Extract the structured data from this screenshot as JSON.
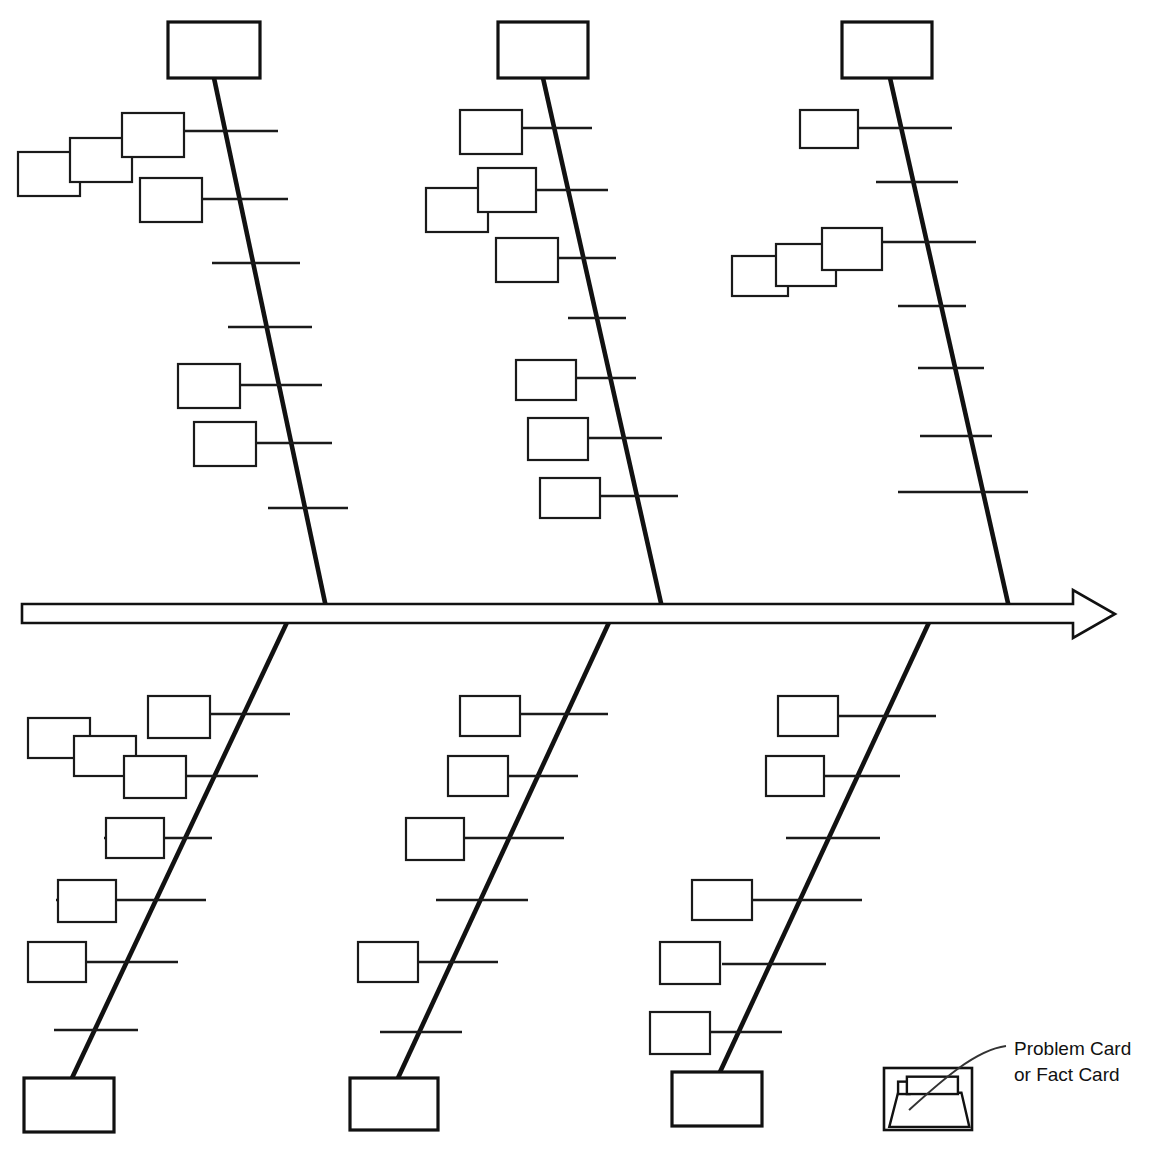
{
  "page": {
    "width": 1149,
    "height": 1162,
    "background_color": "#ffffff",
    "ink_color": "#111111"
  },
  "legend": {
    "label_line_1": "Problem Card",
    "label_line_2": "or Fact Card",
    "icon_name": "card-tray-icon",
    "box": {
      "x": 884,
      "y": 1068,
      "w": 88,
      "h": 62
    },
    "text_x": 1014,
    "text_y_1": 1050,
    "text_y_2": 1076,
    "leader": "M 1006 1046 C 975 1050 940 1082 909 1110"
  },
  "spine": {
    "name": "main-spine-arrow",
    "y_top": 604,
    "y_bottom": 623,
    "x_start": 22,
    "x_body_end": 1073,
    "arrow_tip_x": 1115,
    "arrow_top_y": 590,
    "arrow_bottom_y": 638,
    "outline_points": "22,604 1073,604 1073,590 1115,614 1073,638 1073,623 22,623"
  },
  "chart_data": {
    "type": "diagram",
    "diagram_type": "fishbone",
    "branch_count": 6,
    "upper_branch_count": 3,
    "lower_branch_count": 3,
    "note": "Blank cause-and-effect template: all category head boxes and problem/fact cards are empty."
  },
  "branches": [
    {
      "id": "upper-left",
      "side": "upper",
      "index": 1,
      "line": {
        "x1": 214,
        "y1": 78,
        "x2": 327,
        "y2": 612
      },
      "head": {
        "x": 168,
        "y": 22,
        "w": 92,
        "h": 56
      },
      "ribs": [
        {
          "x1": 124,
          "y1": 131,
          "x2": 278,
          "y2": 131
        },
        {
          "x1": 142,
          "y1": 199,
          "x2": 288,
          "y2": 199
        },
        {
          "x1": 212,
          "y1": 263,
          "x2": 300,
          "y2": 263
        },
        {
          "x1": 228,
          "y1": 327,
          "x2": 312,
          "y2": 327
        },
        {
          "x1": 228,
          "y1": 385,
          "x2": 322,
          "y2": 385
        },
        {
          "x1": 248,
          "y1": 443,
          "x2": 332,
          "y2": 443
        },
        {
          "x1": 268,
          "y1": 508,
          "x2": 348,
          "y2": 508
        }
      ],
      "cards": [
        {
          "x": 18,
          "y": 152,
          "w": 62,
          "h": 44,
          "z": 1
        },
        {
          "x": 70,
          "y": 138,
          "w": 62,
          "h": 44,
          "z": 2
        },
        {
          "x": 122,
          "y": 113,
          "w": 62,
          "h": 44,
          "z": 3
        },
        {
          "x": 140,
          "y": 178,
          "w": 62,
          "h": 44,
          "z": 4
        },
        {
          "x": 178,
          "y": 364,
          "w": 62,
          "h": 44,
          "z": 5
        },
        {
          "x": 194,
          "y": 422,
          "w": 62,
          "h": 44,
          "z": 6
        }
      ]
    },
    {
      "id": "upper-middle",
      "side": "upper",
      "index": 2,
      "line": {
        "x1": 543,
        "y1": 78,
        "x2": 663,
        "y2": 612
      },
      "head": {
        "x": 498,
        "y": 22,
        "w": 90,
        "h": 56
      },
      "ribs": [
        {
          "x1": 520,
          "y1": 128,
          "x2": 592,
          "y2": 128
        },
        {
          "x1": 528,
          "y1": 190,
          "x2": 608,
          "y2": 190
        },
        {
          "x1": 556,
          "y1": 258,
          "x2": 616,
          "y2": 258
        },
        {
          "x1": 568,
          "y1": 318,
          "x2": 626,
          "y2": 318
        },
        {
          "x1": 576,
          "y1": 378,
          "x2": 636,
          "y2": 378
        },
        {
          "x1": 586,
          "y1": 438,
          "x2": 662,
          "y2": 438
        },
        {
          "x1": 596,
          "y1": 496,
          "x2": 678,
          "y2": 496
        }
      ],
      "cards": [
        {
          "x": 460,
          "y": 110,
          "w": 62,
          "h": 44,
          "z": 1
        },
        {
          "x": 426,
          "y": 188,
          "w": 62,
          "h": 44,
          "z": 2
        },
        {
          "x": 478,
          "y": 168,
          "w": 58,
          "h": 44,
          "z": 3
        },
        {
          "x": 496,
          "y": 238,
          "w": 62,
          "h": 44,
          "z": 4
        },
        {
          "x": 516,
          "y": 360,
          "w": 60,
          "h": 40,
          "z": 5
        },
        {
          "x": 528,
          "y": 418,
          "w": 60,
          "h": 42,
          "z": 6
        },
        {
          "x": 540,
          "y": 478,
          "w": 60,
          "h": 40,
          "z": 7
        }
      ]
    },
    {
      "id": "upper-right",
      "side": "upper",
      "index": 3,
      "line": {
        "x1": 890,
        "y1": 78,
        "x2": 1010,
        "y2": 612
      },
      "head": {
        "x": 842,
        "y": 22,
        "w": 90,
        "h": 56
      },
      "ribs": [
        {
          "x1": 858,
          "y1": 128,
          "x2": 952,
          "y2": 128
        },
        {
          "x1": 876,
          "y1": 182,
          "x2": 958,
          "y2": 182
        },
        {
          "x1": 880,
          "y1": 242,
          "x2": 976,
          "y2": 242
        },
        {
          "x1": 898,
          "y1": 306,
          "x2": 966,
          "y2": 306
        },
        {
          "x1": 918,
          "y1": 368,
          "x2": 984,
          "y2": 368
        },
        {
          "x1": 920,
          "y1": 436,
          "x2": 992,
          "y2": 436
        },
        {
          "x1": 898,
          "y1": 492,
          "x2": 1028,
          "y2": 492
        }
      ],
      "cards": [
        {
          "x": 800,
          "y": 110,
          "w": 58,
          "h": 38,
          "z": 1
        },
        {
          "x": 732,
          "y": 256,
          "w": 56,
          "h": 40,
          "z": 2
        },
        {
          "x": 776,
          "y": 244,
          "w": 60,
          "h": 42,
          "z": 3
        },
        {
          "x": 822,
          "y": 228,
          "w": 60,
          "h": 42,
          "z": 4
        }
      ]
    },
    {
      "id": "lower-left",
      "side": "lower",
      "index": 4,
      "line": {
        "x1": 290,
        "y1": 616,
        "x2": 72,
        "y2": 1078
      },
      "head": {
        "x": 24,
        "y": 1078,
        "w": 90,
        "h": 54
      },
      "ribs": [
        {
          "x1": 148,
          "y1": 714,
          "x2": 290,
          "y2": 714
        },
        {
          "x1": 126,
          "y1": 776,
          "x2": 258,
          "y2": 776
        },
        {
          "x1": 104,
          "y1": 838,
          "x2": 212,
          "y2": 838
        },
        {
          "x1": 56,
          "y1": 900,
          "x2": 206,
          "y2": 900
        },
        {
          "x1": 28,
          "y1": 962,
          "x2": 178,
          "y2": 962
        },
        {
          "x1": 54,
          "y1": 1030,
          "x2": 138,
          "y2": 1030
        }
      ],
      "cards": [
        {
          "x": 28,
          "y": 718,
          "w": 62,
          "h": 40,
          "z": 1
        },
        {
          "x": 74,
          "y": 736,
          "w": 62,
          "h": 40,
          "z": 2
        },
        {
          "x": 124,
          "y": 756,
          "w": 62,
          "h": 42,
          "z": 3
        },
        {
          "x": 148,
          "y": 696,
          "w": 62,
          "h": 42,
          "z": 4
        },
        {
          "x": 106,
          "y": 818,
          "w": 58,
          "h": 40,
          "z": 5
        },
        {
          "x": 58,
          "y": 880,
          "w": 58,
          "h": 42,
          "z": 6
        },
        {
          "x": 28,
          "y": 942,
          "w": 58,
          "h": 40,
          "z": 7
        }
      ]
    },
    {
      "id": "lower-middle",
      "side": "lower",
      "index": 5,
      "line": {
        "x1": 612,
        "y1": 616,
        "x2": 398,
        "y2": 1078
      },
      "head": {
        "x": 350,
        "y": 1078,
        "w": 88,
        "h": 52
      },
      "ribs": [
        {
          "x1": 518,
          "y1": 714,
          "x2": 608,
          "y2": 714
        },
        {
          "x1": 500,
          "y1": 776,
          "x2": 578,
          "y2": 776
        },
        {
          "x1": 462,
          "y1": 838,
          "x2": 564,
          "y2": 838
        },
        {
          "x1": 436,
          "y1": 900,
          "x2": 528,
          "y2": 900
        },
        {
          "x1": 406,
          "y1": 962,
          "x2": 498,
          "y2": 962
        },
        {
          "x1": 380,
          "y1": 1032,
          "x2": 462,
          "y2": 1032
        }
      ],
      "cards": [
        {
          "x": 460,
          "y": 696,
          "w": 60,
          "h": 40,
          "z": 1
        },
        {
          "x": 448,
          "y": 756,
          "w": 60,
          "h": 40,
          "z": 2
        },
        {
          "x": 406,
          "y": 818,
          "w": 58,
          "h": 42,
          "z": 3
        },
        {
          "x": 358,
          "y": 942,
          "w": 60,
          "h": 40,
          "z": 4
        }
      ]
    },
    {
      "id": "lower-right",
      "side": "lower",
      "index": 6,
      "line": {
        "x1": 932,
        "y1": 616,
        "x2": 720,
        "y2": 1072
      },
      "head": {
        "x": 672,
        "y": 1072,
        "w": 90,
        "h": 54
      },
      "ribs": [
        {
          "x1": 836,
          "y1": 716,
          "x2": 936,
          "y2": 716
        },
        {
          "x1": 820,
          "y1": 776,
          "x2": 900,
          "y2": 776
        },
        {
          "x1": 786,
          "y1": 838,
          "x2": 880,
          "y2": 838
        },
        {
          "x1": 752,
          "y1": 900,
          "x2": 862,
          "y2": 900
        },
        {
          "x1": 722,
          "y1": 964,
          "x2": 826,
          "y2": 964
        },
        {
          "x1": 684,
          "y1": 1032,
          "x2": 782,
          "y2": 1032
        }
      ],
      "cards": [
        {
          "x": 778,
          "y": 696,
          "w": 60,
          "h": 40,
          "z": 1
        },
        {
          "x": 766,
          "y": 756,
          "w": 58,
          "h": 40,
          "z": 2
        },
        {
          "x": 692,
          "y": 880,
          "w": 60,
          "h": 40,
          "z": 3
        },
        {
          "x": 660,
          "y": 942,
          "w": 60,
          "h": 42,
          "z": 4
        },
        {
          "x": 650,
          "y": 1012,
          "w": 60,
          "h": 42,
          "z": 5
        }
      ]
    }
  ]
}
